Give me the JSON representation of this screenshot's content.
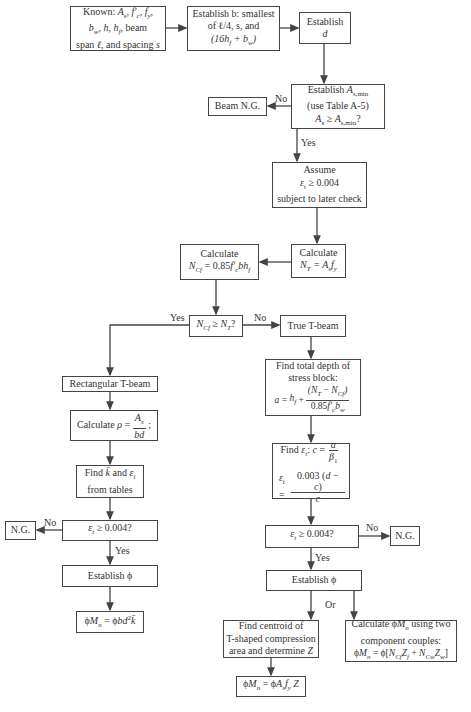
{
  "nodes": {
    "known": {
      "line1": "Known: A",
      "line1b": "s",
      "line1c": ", f′",
      "line1d": "c",
      "line1e": ", f",
      "line1f": "y",
      "line1g": ",",
      "line2": "b",
      "line2b": "w",
      "line2c": ", h, h",
      "line2d": "f",
      "line2e": ", beam",
      "line3": "span ℓ, and spacing s"
    },
    "establish_b": {
      "line1": "Establish b: smallest",
      "line2": "of ℓ/4, s, and",
      "line3": "(16h",
      "line3b": "f",
      "line3c": " + b",
      "line3d": "w",
      "line3e": ")"
    },
    "establish_d": {
      "line1": "Establish",
      "line2": "d"
    },
    "asmin": {
      "line1": "Establish A",
      "line1b": "s,min",
      "line2": "(use Table A-5)",
      "line3": "A",
      "line3b": "s",
      "line3c": " ≥ A",
      "line3d": "s,min",
      "line3e": "?"
    },
    "beam_ng": {
      "label": "Beam N.G."
    },
    "assume": {
      "line1": "Assume",
      "line2": "ε",
      "line2b": "t",
      "line2c": " ≥ 0.004",
      "line3": "subject to later check"
    },
    "calc_nt": {
      "line1": "Calculate",
      "line2": "N",
      "line2b": "T",
      "line2c": " = A",
      "line2d": "s",
      "line2e": "f",
      "line2f": "y"
    },
    "calc_ncf": {
      "line1": "Calculate",
      "line2": "N",
      "line2b": "Cf",
      "line2c": " = 0.85f′",
      "line2d": "c",
      "line2e": "bh",
      "line2f": "f"
    },
    "decision_ncf": {
      "line1": "N",
      "line1b": "Cf",
      "line1c": " ≥ N",
      "line1d": "T",
      "line1e": "?"
    },
    "true_tbeam": {
      "label": "True T-beam"
    },
    "rect_tbeam": {
      "label": "Rectangular T-beam"
    },
    "calc_rho": {
      "prefix": "Calculate ρ = ",
      "num": "A",
      "num_sub": "s",
      "den": "bd",
      "suffix": ";"
    },
    "find_k": {
      "line1": "Find k̄ and ε",
      "line1b": "t",
      "line2": "from tables"
    },
    "left_check": {
      "label": "ε",
      "label_sub": "t",
      "label_rest": " ≥ 0.004?"
    },
    "left_ng": {
      "label": "N.G."
    },
    "left_phi": {
      "label": "Establish ϕ"
    },
    "left_mn": {
      "label": "ϕM",
      "label_sub": "n",
      "label_rest": " = ϕbd",
      "label_sup": "2",
      "label_end": "k̄"
    },
    "depth_a": {
      "line1": "Find total depth of",
      "line2": "stress block:",
      "lhs": "a = h",
      "lhs_sub": "f",
      "lhs_rest": " + ",
      "num": "(N",
      "num_sub": "T",
      "num_mid": " − N",
      "num_sub2": "Cf",
      "num_end": ")",
      "den": "0.85f′",
      "den_sub": "c",
      "den_rest": "b",
      "den_sub2": "w"
    },
    "find_et": {
      "prefix": "Find ε",
      "prefix_sub": "t",
      "prefix_rest": ": c = ",
      "c_num": "a",
      "c_den": "β",
      "c_den_sub": "1",
      "lhs": "ε",
      "lhs_sub": "t",
      "lhs_rest": " = ",
      "num": "0.003 (d − c)",
      "den": "c"
    },
    "right_check": {
      "label": "ε",
      "label_sub": "t",
      "label_rest": " ≥ 0.004?"
    },
    "right_ng": {
      "label": "N.G."
    },
    "right_phi": {
      "label": "Establish ϕ"
    },
    "centroid": {
      "line1": "Find centroid of",
      "line2": "T-shaped compression",
      "line3": "area and determine Z"
    },
    "couples": {
      "line1": "Calculate ϕM",
      "line1b": "n",
      "line1c": " using two",
      "line2": "component couples:",
      "line3": "ϕM",
      "line3b": "n",
      "line3c": " = ϕ[N",
      "line3d": "Cf",
      "line3e": "Z",
      "line3f": "f",
      "line3g": " + N",
      "line3h": "Cw",
      "line3i": "Z",
      "line3j": "w",
      "line3k": "]"
    },
    "right_mn": {
      "label": "ϕM",
      "label_sub": "n",
      "label_rest": " = ϕA",
      "label_sub2": "s",
      "label_f": "f",
      "label_sub3": "y",
      "label_end": " Z"
    }
  },
  "edge_labels": {
    "asmin_no": "No",
    "asmin_yes": "Yes",
    "ncf_yes": "Yes",
    "ncf_no": "No",
    "left_no": "No",
    "left_yes": "Yes",
    "right_no": "No",
    "right_yes": "Yes",
    "or": "Or"
  },
  "colors": {
    "line": "#444444",
    "text": "#333333",
    "background": "#ffffff"
  }
}
